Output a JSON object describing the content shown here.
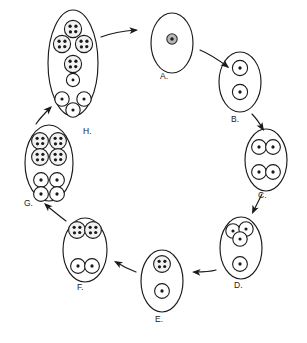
{
  "diagram": {
    "type": "cyclic-process-diagram",
    "direction": "clockwise",
    "colors": {
      "background": "#ffffff",
      "outline": "#1a1a1a",
      "spore_fill": "#ffffff",
      "dotted_spore_fill": "#f2f2f2",
      "nucleus_fill": "#b8b8b8",
      "granule": "#1a1a1a"
    },
    "stages": [
      {
        "id": "A",
        "label": "A.",
        "label_x": 160,
        "label_y": 79,
        "cell": {
          "cx": 172,
          "cy": 43,
          "rx": 21,
          "ry": 30
        },
        "contents": [
          {
            "kind": "nucleus",
            "cx": 172,
            "cy": 39,
            "r": 5.2
          }
        ]
      },
      {
        "id": "B",
        "label": "B.",
        "label_x": 231,
        "label_y": 122,
        "cell": {
          "cx": 240,
          "cy": 82,
          "rx": 21,
          "ry": 30
        },
        "contents": [
          {
            "kind": "plain",
            "cx": 240,
            "cy": 68,
            "r": 7.6,
            "dots": 1
          },
          {
            "kind": "plain",
            "cx": 240,
            "cy": 92,
            "r": 7.6,
            "dots": 1
          }
        ]
      },
      {
        "id": "C",
        "label": "C.",
        "label_x": 258,
        "label_y": 198,
        "cell": {
          "cx": 266,
          "cy": 160,
          "rx": 21,
          "ry": 31
        },
        "contents": [
          {
            "kind": "plain",
            "cx": 259,
            "cy": 147,
            "r": 7.4,
            "dots": 1
          },
          {
            "kind": "plain",
            "cx": 273,
            "cy": 147,
            "r": 7.4,
            "dots": 1
          },
          {
            "kind": "plain",
            "cx": 259,
            "cy": 172,
            "r": 7.4,
            "dots": 1
          },
          {
            "kind": "plain",
            "cx": 273,
            "cy": 172,
            "r": 7.4,
            "dots": 1
          }
        ]
      },
      {
        "id": "D",
        "label": "D.",
        "label_x": 234,
        "label_y": 288,
        "cell": {
          "cx": 241,
          "cy": 248,
          "rx": 21,
          "ry": 31
        },
        "contents": [
          {
            "kind": "plain",
            "cx": 233,
            "cy": 231,
            "r": 7.2,
            "dots": 1
          },
          {
            "kind": "plain",
            "cx": 246,
            "cy": 229,
            "r": 7.2,
            "dots": 1
          },
          {
            "kind": "plain",
            "cx": 240,
            "cy": 239,
            "r": 7.2,
            "dots": 1
          },
          {
            "kind": "plain",
            "cx": 240,
            "cy": 264,
            "r": 7.4,
            "dots": 1
          }
        ]
      },
      {
        "id": "E",
        "label": "E.",
        "label_x": 155,
        "label_y": 322,
        "cell": {
          "cx": 162,
          "cy": 281,
          "rx": 21,
          "ry": 31
        },
        "contents": [
          {
            "kind": "dotted",
            "cx": 162,
            "cy": 264,
            "r": 8.4,
            "dots": 4
          },
          {
            "kind": "plain",
            "cx": 162,
            "cy": 291,
            "r": 7.4,
            "dots": 1
          }
        ]
      },
      {
        "id": "F",
        "label": "F.",
        "label_x": 77,
        "label_y": 290,
        "cell": {
          "cx": 85,
          "cy": 250,
          "rx": 22,
          "ry": 32
        },
        "contents": [
          {
            "kind": "dotted",
            "cx": 77,
            "cy": 230,
            "r": 8.4,
            "dots": 4
          },
          {
            "kind": "dotted",
            "cx": 93,
            "cy": 230,
            "r": 8.4,
            "dots": 4
          },
          {
            "kind": "plain",
            "cx": 78,
            "cy": 266,
            "r": 7.4,
            "dots": 1
          },
          {
            "kind": "plain",
            "cx": 92,
            "cy": 266,
            "r": 7.4,
            "dots": 1
          }
        ]
      },
      {
        "id": "G",
        "label": "G.",
        "label_x": 24,
        "label_y": 206,
        "cell": {
          "cx": 49,
          "cy": 163,
          "rx": 24,
          "ry": 38
        },
        "contents": [
          {
            "kind": "dotted",
            "cx": 40,
            "cy": 141,
            "r": 8.4,
            "dots": 4
          },
          {
            "kind": "dotted",
            "cx": 58,
            "cy": 141,
            "r": 8.4,
            "dots": 4
          },
          {
            "kind": "dotted",
            "cx": 40,
            "cy": 157,
            "r": 8.4,
            "dots": 4
          },
          {
            "kind": "dotted",
            "cx": 58,
            "cy": 157,
            "r": 8.4,
            "dots": 4
          },
          {
            "kind": "plain",
            "cx": 41,
            "cy": 180,
            "r": 7.4,
            "dots": 1
          },
          {
            "kind": "plain",
            "cx": 57,
            "cy": 180,
            "r": 7.4,
            "dots": 1
          },
          {
            "kind": "plain",
            "cx": 41,
            "cy": 194,
            "r": 7.4,
            "dots": 1
          },
          {
            "kind": "plain",
            "cx": 57,
            "cy": 194,
            "r": 7.4,
            "dots": 1
          }
        ]
      },
      {
        "id": "H",
        "label": "H.",
        "label_x": 83,
        "label_y": 134,
        "cell": {
          "cx": 73,
          "cy": 63,
          "rx": 25,
          "ry": 53
        },
        "contents": [
          {
            "kind": "dotted",
            "cx": 73,
            "cy": 29,
            "r": 8.6,
            "dots": 4
          },
          {
            "kind": "dotted",
            "cx": 62,
            "cy": 44,
            "r": 8.6,
            "dots": 4
          },
          {
            "kind": "dotted",
            "cx": 84,
            "cy": 44,
            "r": 8.6,
            "dots": 4
          },
          {
            "kind": "dotted",
            "cx": 73,
            "cy": 64,
            "r": 8.6,
            "dots": 4
          },
          {
            "kind": "plain",
            "cx": 73,
            "cy": 80,
            "r": 6.6,
            "dots": 1
          },
          {
            "kind": "plain",
            "cx": 62,
            "cy": 99,
            "r": 7.2,
            "dots": 1
          },
          {
            "kind": "plain",
            "cx": 84,
            "cy": 99,
            "r": 7.2,
            "dots": 1
          },
          {
            "kind": "plain",
            "cx": 73,
            "cy": 110,
            "r": 7.2,
            "dots": 1
          }
        ]
      }
    ],
    "arrows": [
      {
        "id": "a-to-b",
        "from": "A",
        "to": "B",
        "path": "M 200 50 C 212 55 220 61 228 67",
        "tip_x": 229,
        "tip_y": 68,
        "angle": 40
      },
      {
        "id": "b-to-c",
        "from": "B",
        "to": "C",
        "path": "M 252 114 C 257 119 260 124 263 129",
        "tip_x": 264,
        "tip_y": 131,
        "angle": 58
      },
      {
        "id": "c-to-d",
        "from": "C",
        "to": "D",
        "path": "M 262 194 C 259 200 256 206 253 212",
        "tip_x": 252,
        "tip_y": 214,
        "angle": 115
      },
      {
        "id": "d-to-e",
        "from": "D",
        "to": "E",
        "path": "M 216 270 C 209 272 202 272 195 272",
        "tip_x": 192,
        "tip_y": 272,
        "angle": 183
      },
      {
        "id": "e-to-f",
        "from": "E",
        "to": "F",
        "path": "M 136 272 C 128 269 122 266 116 262",
        "tip_x": 114,
        "tip_y": 261,
        "angle": 209
      },
      {
        "id": "f-to-g",
        "from": "F",
        "to": "G",
        "path": "M 66 221 C 58 215 52 210 46 205",
        "tip_x": 44,
        "tip_y": 203,
        "angle": 222
      },
      {
        "id": "g-to-h",
        "from": "G",
        "to": "H",
        "path": "M 36 124 C 40 118 45 113 50 108",
        "tip_x": 52,
        "tip_y": 106,
        "angle": 315
      },
      {
        "id": "h-to-a",
        "from": "H",
        "to": "A",
        "path": "M 101 37 C 112 33 124 31 136 30",
        "tip_x": 138,
        "tip_y": 30,
        "angle": 356
      }
    ]
  }
}
